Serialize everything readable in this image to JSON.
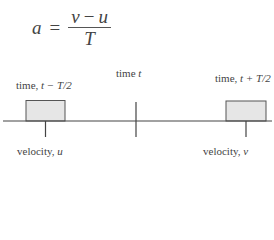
{
  "formula": {
    "lhs": "a",
    "equals": "=",
    "numerator_a": "v",
    "numerator_op": "−",
    "numerator_b": "u",
    "denominator": "T"
  },
  "labels": {
    "left_time_prefix": "time, ",
    "left_time_expr": "t − T/2",
    "center_time_prefix": "time ",
    "center_time_expr": "t",
    "right_time_prefix": "time, ",
    "right_time_expr": "t + T/2",
    "left_velocity_prefix": "velocity, ",
    "left_velocity_var": "u",
    "right_velocity_prefix": "velocity, ",
    "right_velocity_var": "v"
  },
  "colors": {
    "line": "#444444",
    "box_fill": "#e6e6e6",
    "box_stroke": "#555555"
  }
}
